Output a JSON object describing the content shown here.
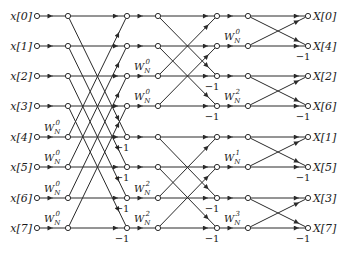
{
  "colors": {
    "line": "#2a2a2a",
    "node_fill": "#ffffff",
    "text": "#1a1a1a"
  },
  "columns_x": [
    37,
    68,
    127,
    158,
    217,
    248,
    308
  ],
  "rows_y": [
    16,
    46,
    76,
    106,
    137,
    167,
    198,
    228
  ],
  "inputs": [
    "x[0]",
    "x[1]",
    "x[2]",
    "x[3]",
    "x[4]",
    "x[5]",
    "x[6]",
    "x[7]"
  ],
  "outputs": [
    "X[0]",
    "X[4]",
    "X[2]",
    "X[6]",
    "X[1]",
    "X[5]",
    "X[3]",
    "X[7]"
  ],
  "twiddles": {
    "stage1": [
      {
        "row": 4,
        "label": "W",
        "sub": "N",
        "sup": "0"
      },
      {
        "row": 5,
        "label": "W",
        "sub": "N",
        "sup": "0"
      },
      {
        "row": 6,
        "label": "W",
        "sub": "N",
        "sup": "0"
      },
      {
        "row": 7,
        "label": "W",
        "sub": "N",
        "sup": "0"
      }
    ],
    "stage2": [
      {
        "row": 2,
        "label": "W",
        "sub": "N",
        "sup": "0"
      },
      {
        "row": 3,
        "label": "W",
        "sub": "N",
        "sup": "0"
      },
      {
        "row": 6,
        "label": "W",
        "sub": "N",
        "sup": "2"
      },
      {
        "row": 7,
        "label": "W",
        "sub": "N",
        "sup": "2"
      }
    ],
    "stage3": [
      {
        "row": 1,
        "label": "W",
        "sub": "N",
        "sup": "0"
      },
      {
        "row": 3,
        "label": "W",
        "sub": "N",
        "sup": "2"
      },
      {
        "row": 5,
        "label": "W",
        "sub": "N",
        "sup": "1"
      },
      {
        "row": 7,
        "label": "W",
        "sub": "N",
        "sup": "3"
      }
    ]
  },
  "minus_one": {
    "label": "−1",
    "stage1_rows": [
      4,
      5,
      6,
      7
    ],
    "stage2_rows": [
      2,
      3,
      6,
      7
    ],
    "stage3_rows": [
      1,
      3,
      5,
      7
    ]
  },
  "butterfly_spans": {
    "stage1": 4,
    "stage2": 2,
    "stage3": 1
  }
}
